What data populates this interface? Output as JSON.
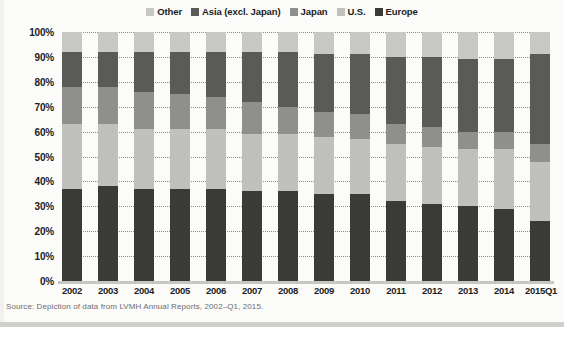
{
  "colors": {
    "other": "#c8c8c6",
    "asia": "#5a5a58",
    "japan": "#8f8f8d",
    "us": "#c0c0be",
    "europe": "#3a3a38",
    "grid": "#8d8d8d",
    "text": "#1d1d1d",
    "source_text": "#6e6e6e",
    "background": "#fbfbfa"
  },
  "legend": {
    "items": [
      {
        "label": "Other",
        "color": "#c8c8c6",
        "key": "other"
      },
      {
        "label": "Asia (excl. Japan)",
        "color": "#5a5a58",
        "key": "asia"
      },
      {
        "label": "Japan",
        "color": "#8f8f8d",
        "key": "japan"
      },
      {
        "label": "U.S.",
        "color": "#c0c0be",
        "key": "us"
      },
      {
        "label": "Europe",
        "color": "#3a3a38",
        "key": "europe"
      }
    ]
  },
  "source": "Source: Depiction of data from LVMH Annual Reports, 2002–Q1, 2015.",
  "chart_data": {
    "type": "bar",
    "stacked": true,
    "stack_total": 100,
    "title": "",
    "subtitle": "",
    "xlabel": "",
    "ylabel": "",
    "ylim": [
      0,
      100
    ],
    "yunit": "%",
    "grid": true,
    "legend_position": "top",
    "categories": [
      "2002",
      "2003",
      "2004",
      "2005",
      "2006",
      "2007",
      "2008",
      "2009",
      "2010",
      "2011",
      "2012",
      "2013",
      "2014",
      "2015Q1"
    ],
    "ytick_labels": [
      "0%",
      "10%",
      "20%",
      "30%",
      "40%",
      "50%",
      "60%",
      "70%",
      "80%",
      "90%",
      "100%"
    ],
    "ytick_values": [
      0,
      10,
      20,
      30,
      40,
      50,
      60,
      70,
      80,
      90,
      100
    ],
    "series": [
      {
        "name": "Europe",
        "color": "#3a3a38",
        "values": [
          37,
          38,
          37,
          37,
          37,
          36,
          36,
          35,
          35,
          32,
          31,
          30,
          29,
          24
        ]
      },
      {
        "name": "U.S.",
        "color": "#c0c0be",
        "values": [
          26,
          25,
          24,
          24,
          24,
          23,
          23,
          23,
          22,
          23,
          23,
          23,
          24,
          24
        ]
      },
      {
        "name": "Japan",
        "color": "#8f8f8d",
        "values": [
          15,
          15,
          15,
          14,
          13,
          13,
          11,
          10,
          10,
          8,
          8,
          7,
          7,
          7
        ]
      },
      {
        "name": "Asia (excl. Japan)",
        "color": "#5a5a58",
        "values": [
          14,
          14,
          16,
          17,
          18,
          20,
          22,
          23,
          24,
          27,
          28,
          29,
          29,
          36
        ]
      },
      {
        "name": "Other",
        "color": "#c8c8c6",
        "values": [
          8,
          8,
          8,
          8,
          8,
          8,
          8,
          9,
          9,
          10,
          10,
          11,
          11,
          9
        ]
      }
    ]
  }
}
